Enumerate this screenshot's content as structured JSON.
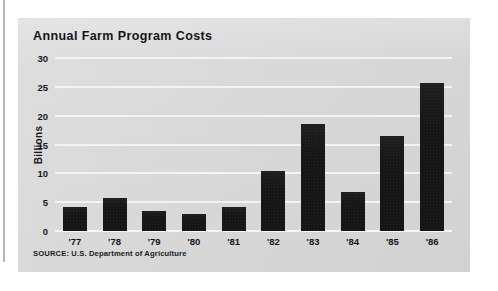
{
  "page": {
    "background_color": "#ffffff",
    "panel_color": "#d9d9d9",
    "bar_color": "#161616",
    "gridline_color": "#f3f3f3"
  },
  "chart_data": {
    "type": "bar",
    "title": "Annual Farm Program Costs",
    "xlabel": "",
    "ylabel": "Billions",
    "categories": [
      "'77",
      "'78",
      "'79",
      "'80",
      "'81",
      "'82",
      "'83",
      "'84",
      "'85",
      "'86"
    ],
    "values": [
      4.1,
      5.7,
      3.5,
      3.0,
      4.1,
      10.4,
      18.5,
      6.8,
      16.4,
      25.6
    ],
    "ylim": [
      0,
      30
    ],
    "yticks": [
      0,
      5,
      10,
      15,
      20,
      25,
      30
    ],
    "ytick_labels": [
      "0",
      "5",
      "10",
      "15",
      "20",
      "25",
      "30"
    ],
    "grid": true,
    "legend": "none",
    "source": "SOURCE: U.S. Department of Agriculture"
  }
}
